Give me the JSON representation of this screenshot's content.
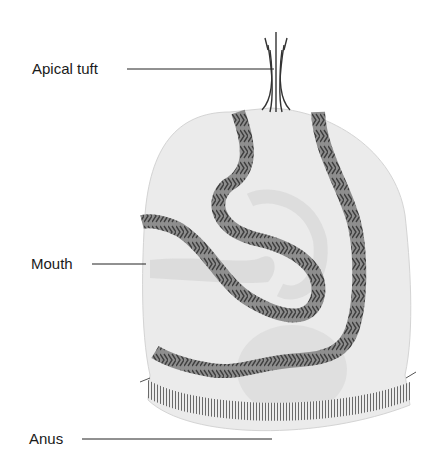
{
  "diagram": {
    "type": "anatomical illustration",
    "labels": [
      {
        "id": "apical-tuft",
        "text": "Apical tuft"
      },
      {
        "id": "mouth",
        "text": "Mouth"
      },
      {
        "id": "anus",
        "text": "Anus"
      }
    ],
    "colors": {
      "body_fill": "#e8e8e8",
      "ciliary_band": "#8a8a8a",
      "chevron": "#4a4a4a",
      "gut": "#d6d6d6",
      "leader_line": "#222222"
    }
  }
}
